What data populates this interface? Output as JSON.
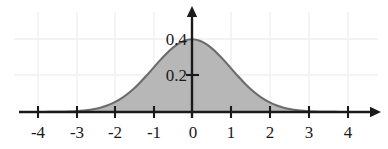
{
  "chart_data": {
    "type": "area",
    "title": "",
    "subtitle": "",
    "xlabel": "",
    "ylabel": "",
    "xlim": [
      -4.45,
      4.75
    ],
    "ylim": [
      -0.035,
      0.49
    ],
    "xticks": [
      -4,
      -3,
      -2,
      -1,
      0,
      1,
      2,
      3,
      4
    ],
    "xtick_labels": [
      "-4",
      "-3",
      "-2",
      "-1",
      "0",
      "1",
      "2",
      "3",
      "4"
    ],
    "yticks": [
      0.2,
      0.4
    ],
    "ytick_labels": [
      "0.2",
      "0.4"
    ],
    "grid": true,
    "legend": null,
    "annotations": [],
    "series": [
      {
        "name": "standard normal density",
        "fill": true,
        "x": [
          -4.4,
          -4.2,
          -4.0,
          -3.8,
          -3.6,
          -3.4,
          -3.2,
          -3.0,
          -2.8,
          -2.6,
          -2.4,
          -2.2,
          -2.0,
          -1.8,
          -1.6,
          -1.4,
          -1.2,
          -1.0,
          -0.8,
          -0.6,
          -0.4,
          -0.2,
          0.0,
          0.2,
          0.4,
          0.6,
          0.8,
          1.0,
          1.2,
          1.4,
          1.6,
          1.8,
          2.0,
          2.2,
          2.4,
          2.6,
          2.8,
          3.0,
          3.2,
          3.4,
          3.6,
          3.8,
          4.0,
          4.2,
          4.4
        ],
        "y": [
          0.0,
          0.0001,
          0.0001,
          0.0003,
          0.0006,
          0.0012,
          0.0024,
          0.0044,
          0.0079,
          0.0136,
          0.0224,
          0.0355,
          0.054,
          0.079,
          0.1109,
          0.1497,
          0.1942,
          0.242,
          0.2897,
          0.3332,
          0.3683,
          0.391,
          0.3989,
          0.391,
          0.3683,
          0.3332,
          0.2897,
          0.242,
          0.1942,
          0.1497,
          0.1109,
          0.079,
          0.054,
          0.0355,
          0.0224,
          0.0136,
          0.0079,
          0.0044,
          0.0024,
          0.0012,
          0.0006,
          0.0003,
          0.0001,
          0.0001,
          0.0
        ]
      }
    ],
    "peak": {
      "x": 0,
      "y": 0.3989
    },
    "colors": {
      "fill": "#b3b3b3",
      "curve": "#6b6b6b",
      "axis": "#1a1a1a",
      "grid": "#f0eef0",
      "text": "#1a1a1a",
      "background": "#ffffff"
    }
  },
  "axis": {
    "x_tick_labels": [
      "-4",
      "-3",
      "-2",
      "-1",
      "0",
      "1",
      "2",
      "3",
      "4"
    ],
    "y_tick_labels": [
      "0.2",
      "0.4"
    ]
  }
}
